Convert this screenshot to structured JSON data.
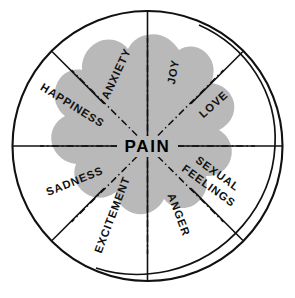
{
  "diagram": {
    "center_label": "PAIN",
    "shape": "circle",
    "colors": {
      "blob_fill": "#b9b9b9",
      "stroke": "#111111",
      "background": "#ffffff",
      "text": "#111111"
    },
    "sectors": [
      {
        "id": "joy",
        "label": "JOY",
        "position": "top-right"
      },
      {
        "id": "love",
        "label": "LOVE",
        "position": "upper-right"
      },
      {
        "id": "sexual-feelings",
        "label": "SEXUAL\nFEELINGS",
        "line1": "SEXUAL",
        "line2": "FEELINGS",
        "position": "lower-right"
      },
      {
        "id": "anger",
        "label": "ANGER",
        "position": "bottom-right"
      },
      {
        "id": "excitement",
        "label": "EXCITEMENT",
        "position": "bottom-left"
      },
      {
        "id": "sadness",
        "label": "SADNESS",
        "position": "lower-left"
      },
      {
        "id": "happiness",
        "label": "HAPPINESS",
        "position": "upper-left"
      },
      {
        "id": "anxiety",
        "label": "ANXIETY",
        "position": "top-left"
      }
    ]
  }
}
